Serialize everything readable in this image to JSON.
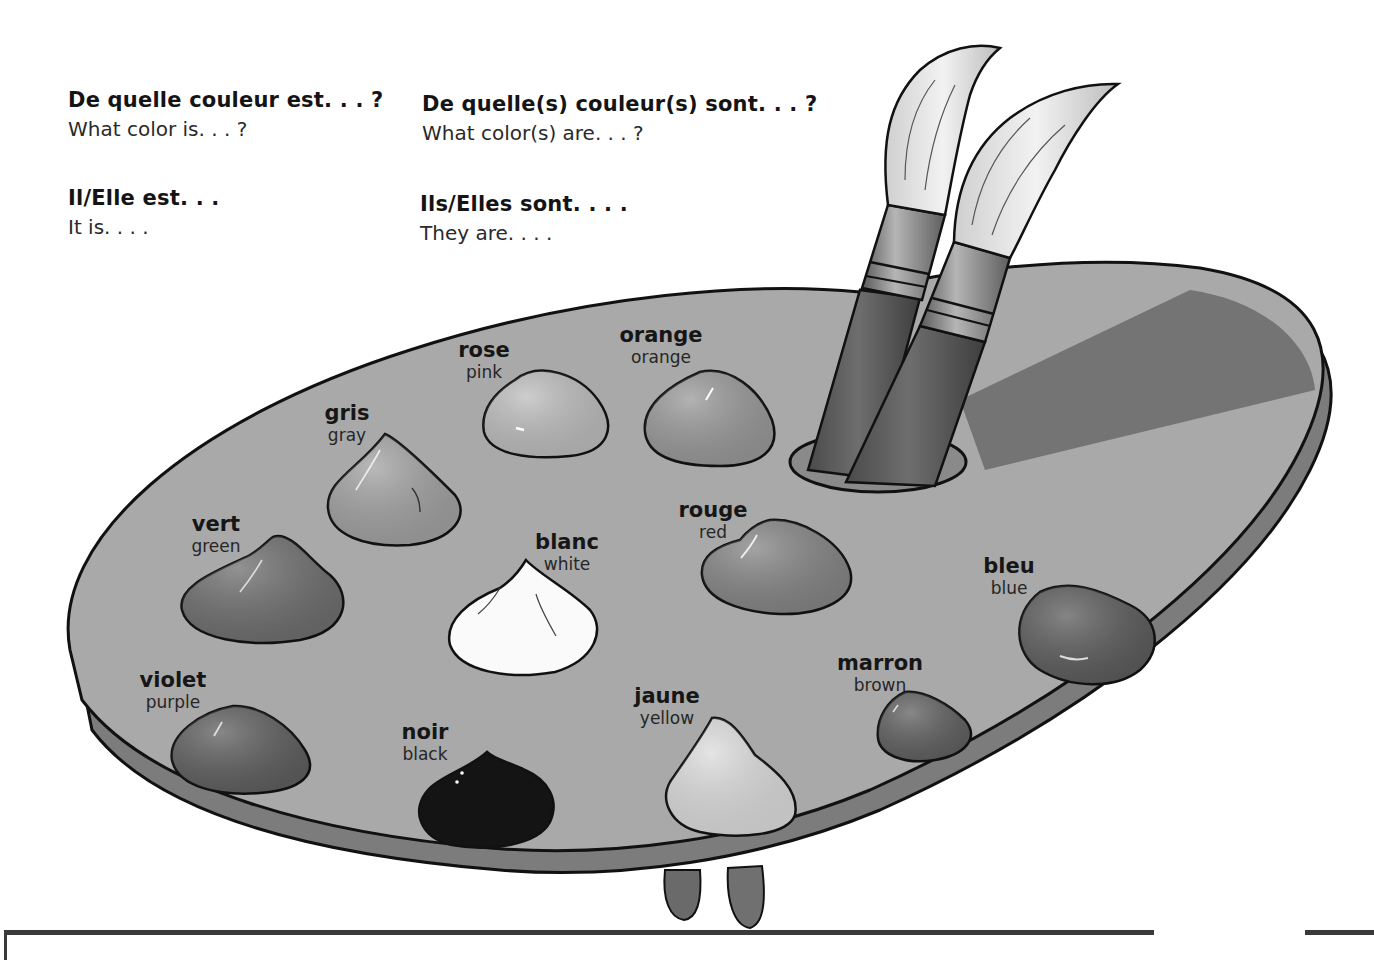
{
  "phrases": {
    "singular_question": {
      "fr": "De quelle couleur est. . . ?",
      "en": "What color is. . . ?"
    },
    "plural_question": {
      "fr": "De quelle(s) couleur(s) sont. . . ?",
      "en": "What color(s) are. . . ?"
    },
    "singular_answer": {
      "fr": "Il/Elle est. . .",
      "en": "It is. . . ."
    },
    "plural_answer": {
      "fr": "Ils/Elles sont. . . .",
      "en": "They are. . . ."
    }
  },
  "illustration": {
    "subject": "artist-palette-with-two-brushes",
    "colors": {
      "palette_top": "#a9a9a9",
      "palette_rim": "#7c7c7c",
      "shadow": "#6e6e6e",
      "outline": "#111111"
    }
  },
  "paints": [
    {
      "fr": "rose",
      "en": "pink",
      "shade": "#bdbdbd"
    },
    {
      "fr": "orange",
      "en": "orange",
      "shade": "#999999"
    },
    {
      "fr": "gris",
      "en": "gray",
      "shade": "#a2a2a2"
    },
    {
      "fr": "vert",
      "en": "green",
      "shade": "#6f6f6f"
    },
    {
      "fr": "blanc",
      "en": "white",
      "shade": "#fafafa"
    },
    {
      "fr": "rouge",
      "en": "red",
      "shade": "#858585"
    },
    {
      "fr": "bleu",
      "en": "blue",
      "shade": "#5c5c5c"
    },
    {
      "fr": "violet",
      "en": "purple",
      "shade": "#5f5f5f"
    },
    {
      "fr": "noir",
      "en": "black",
      "shade": "#141414"
    },
    {
      "fr": "jaune",
      "en": "yellow",
      "shade": "#dcdcdc"
    },
    {
      "fr": "marron",
      "en": "brown",
      "shade": "#606060"
    }
  ]
}
